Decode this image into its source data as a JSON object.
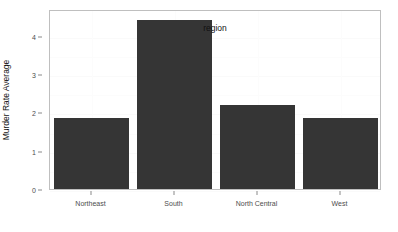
{
  "chart_data": {
    "type": "bar",
    "title": "",
    "subtitle": "",
    "categories": [
      "Northeast",
      "South",
      "North Central",
      "West"
    ],
    "values": [
      1.85,
      4.42,
      2.19,
      1.85
    ],
    "series": [
      {
        "name": "Murder Rate Average",
        "values": [
          1.85,
          4.42,
          2.19,
          1.85
        ]
      }
    ],
    "xlabel": "region",
    "ylabel": "Murder Rate Average",
    "ylim": [
      0,
      4.7
    ],
    "yticks": [
      0,
      1,
      2,
      3,
      4
    ],
    "ytick_labels": [
      "0",
      "1",
      "2",
      "3",
      "4"
    ],
    "xtick_labels": [
      "Northeast",
      "South",
      "North Central",
      "West"
    ],
    "grid": true,
    "grid_color": "#fafafa",
    "legend": false,
    "legend_position": "none",
    "bar_color": "#353535",
    "panel_background": "#ffffff",
    "panel_border_color": "#bfbfbf",
    "axis_text_color": "#4d4d4d",
    "axis_title_color": "#111111",
    "annotations": []
  },
  "axes": {
    "y_title": "Murder Rate Average",
    "x_title": "region",
    "y_ticks": [
      {
        "label": "4",
        "value": 4
      },
      {
        "label": "3",
        "value": 3
      },
      {
        "label": "2",
        "value": 2
      },
      {
        "label": "1",
        "value": 1
      },
      {
        "label": "0",
        "value": 0
      }
    ],
    "x_ticks": [
      {
        "label": "Northeast"
      },
      {
        "label": "South"
      },
      {
        "label": "North Central"
      },
      {
        "label": "West"
      }
    ]
  },
  "bars": [
    {
      "category": "Northeast",
      "value": 1.85
    },
    {
      "category": "South",
      "value": 4.42
    },
    {
      "category": "North Central",
      "value": 2.19
    },
    {
      "category": "West",
      "value": 1.85
    }
  ]
}
